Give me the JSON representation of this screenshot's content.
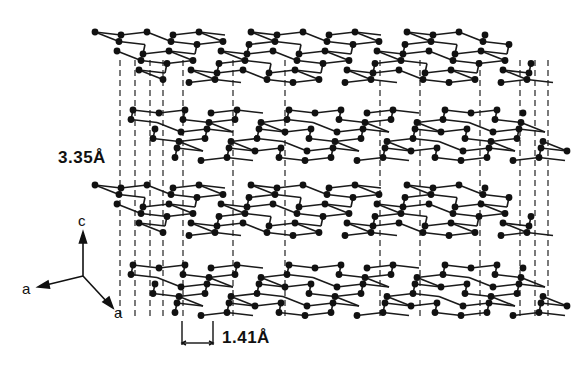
{
  "figure": {
    "colors": {
      "atom": "#111111",
      "bond": "#1a1a1a",
      "dash": "#222222",
      "background": "#ffffff"
    }
  },
  "labels": {
    "interlayer_spacing": "3.35Å",
    "bond_length": "1.41Å"
  },
  "axes": {
    "c": "c",
    "a1": "a",
    "a2": "a"
  },
  "layers": [
    {
      "name": "layer-1",
      "x0": 95,
      "y0": 32,
      "shift": 0
    },
    {
      "name": "layer-2",
      "x0": 120,
      "y0": 110,
      "shift": 1
    },
    {
      "name": "layer-3",
      "x0": 95,
      "y0": 185,
      "shift": 0
    },
    {
      "name": "layer-4",
      "x0": 120,
      "y0": 265,
      "shift": 1
    }
  ],
  "lattice": {
    "cols": 16,
    "rows": 6,
    "dx": 26,
    "dy": 9.5,
    "skew": 11
  },
  "dashed_columns_x": [
    120,
    135,
    150,
    163,
    183,
    233,
    285,
    380,
    420,
    480,
    520,
    535,
    548
  ]
}
